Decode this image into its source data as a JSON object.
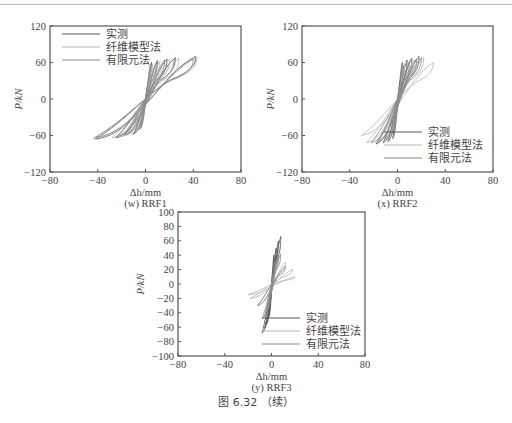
{
  "figure_caption": "图 6.32 （续）",
  "chart_data": [
    {
      "type": "line",
      "subtitle": "(w) RRF1",
      "xlabel": "Δh/mm",
      "ylabel": "P/kN",
      "xlim": [
        -80,
        80
      ],
      "ylim": [
        -120,
        120
      ],
      "xticks": [
        -80,
        -40,
        0,
        40,
        80
      ],
      "yticks": [
        -120,
        -60,
        0,
        60,
        120
      ],
      "grid": false,
      "legend_position": "upper-left",
      "legend": [
        "实测",
        "纤维模型法",
        "有限元法"
      ],
      "frame": {
        "x": 50,
        "y": 26,
        "w": 191,
        "h": 146
      },
      "legend_box": {
        "x": 62,
        "y": 34
      },
      "series": [
        {
          "name": "实测",
          "color": "#555555",
          "loops": [
            [
              5,
              60,
              -5,
              -50
            ],
            [
              10,
              63,
              -10,
              -58
            ],
            [
              18,
              66,
              -18,
              -60
            ],
            [
              25,
              68,
              -25,
              -64
            ],
            [
              42,
              70,
              -42,
              -66
            ]
          ]
        },
        {
          "name": "纤维模型法",
          "color": "#b5b5b5",
          "loops": [
            [
              6,
              58,
              -6,
              -52
            ],
            [
              12,
              62,
              -12,
              -58
            ],
            [
              20,
              65,
              -20,
              -62
            ],
            [
              28,
              67,
              -28,
              -64
            ],
            [
              43,
              68,
              -44,
              -65
            ]
          ]
        },
        {
          "name": "有限元法",
          "color": "#8a8a8a",
          "loops": [
            [
              4,
              55,
              -4,
              -48
            ],
            [
              9,
              60,
              -9,
              -55
            ],
            [
              16,
              64,
              -16,
              -59
            ],
            [
              24,
              66,
              -24,
              -62
            ],
            [
              40,
              66,
              -42,
              -63
            ]
          ]
        }
      ]
    },
    {
      "type": "line",
      "subtitle": "(x) RRF2",
      "xlabel": "Δh/mm",
      "ylabel": "P/kN",
      "xlim": [
        -80,
        80
      ],
      "ylim": [
        -120,
        120
      ],
      "xticks": [
        -80,
        -40,
        0,
        40,
        80
      ],
      "yticks": [
        -120,
        -60,
        0,
        60,
        120
      ],
      "grid": false,
      "legend_position": "lower-right",
      "legend": [
        "实测",
        "纤维模型法",
        "有限元法"
      ],
      "frame": {
        "x": 302,
        "y": 26,
        "w": 191,
        "h": 146
      },
      "legend_box": {
        "x": 384,
        "y": 132
      },
      "series": [
        {
          "name": "实测",
          "color": "#555555",
          "loops": [
            [
              4,
              60,
              -4,
              -65
            ],
            [
              8,
              64,
              -8,
              -70
            ],
            [
              12,
              67,
              -12,
              -72
            ],
            [
              18,
              70,
              -18,
              -74
            ]
          ]
        },
        {
          "name": "纤维模型法",
          "color": "#b5b5b5",
          "loops": [
            [
              6,
              58,
              -6,
              -60
            ],
            [
              14,
              64,
              -16,
              -68
            ],
            [
              22,
              68,
              -26,
              -72
            ],
            [
              30,
              60,
              -30,
              -60
            ]
          ]
        },
        {
          "name": "有限元法",
          "color": "#8a8a8a",
          "loops": [
            [
              5,
              55,
              -5,
              -58
            ],
            [
              10,
              62,
              -10,
              -66
            ],
            [
              16,
              66,
              -16,
              -70
            ],
            [
              20,
              68,
              -22,
              -72
            ]
          ]
        }
      ]
    },
    {
      "type": "line",
      "subtitle": "(y) RRF3",
      "xlabel": "Δh/mm",
      "ylabel": "P/kN",
      "xlim": [
        -80,
        80
      ],
      "ylim": [
        -100,
        100
      ],
      "xticks": [
        -80,
        -40,
        0,
        40,
        80
      ],
      "yticks": [
        -100,
        -80,
        -60,
        -40,
        -20,
        0,
        20,
        40,
        60,
        80,
        100
      ],
      "grid": false,
      "legend_position": "lower-right",
      "legend": [
        "实测",
        "纤维模型法",
        "有限元法"
      ],
      "frame": {
        "x": 178,
        "y": 212,
        "w": 187,
        "h": 144
      },
      "legend_box": {
        "x": 262,
        "y": 318
      },
      "series": [
        {
          "name": "实测",
          "color": "#555555",
          "loops": [
            [
              2,
              40,
              -2,
              -45
            ],
            [
              4,
              50,
              -4,
              -55
            ],
            [
              6,
              60,
              -6,
              -62
            ],
            [
              8,
              66,
              -8,
              -68
            ]
          ]
        },
        {
          "name": "纤维模型法",
          "color": "#b5b5b5",
          "loops": [
            [
              5,
              35,
              -5,
              -40
            ],
            [
              12,
              30,
              -12,
              -30
            ],
            [
              18,
              20,
              -18,
              -20
            ],
            [
              20,
              10,
              -20,
              -15
            ]
          ]
        },
        {
          "name": "有限元法",
          "color": "#8a8a8a",
          "loops": [
            [
              3,
              30,
              -3,
              -35
            ],
            [
              6,
              40,
              -6,
              -45
            ],
            [
              8,
              42,
              -8,
              -48
            ],
            [
              12,
              25,
              -12,
              -30
            ]
          ]
        }
      ]
    }
  ]
}
